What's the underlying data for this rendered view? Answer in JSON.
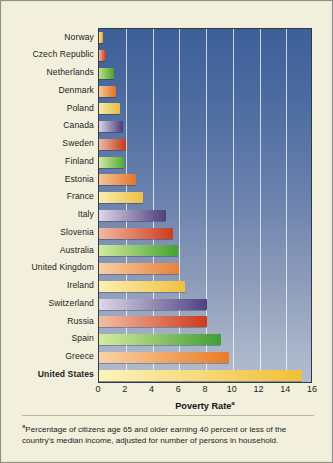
{
  "chart_data": {
    "type": "bar",
    "orientation": "horizontal",
    "title": "",
    "xlabel": "Poverty Rate",
    "xlabel_superscript": "a",
    "ylabel": "",
    "xlim": [
      0,
      16
    ],
    "xticks": [
      0,
      2,
      4,
      6,
      8,
      10,
      12,
      14,
      16
    ],
    "xtick_labels": [
      "0",
      "2",
      "4",
      "6",
      "8",
      "10",
      "12",
      "14",
      "16"
    ],
    "grid": "vertical-only",
    "legend": "none",
    "categories": [
      "Norway",
      "Czech Republic",
      "Netherlands",
      "Denmark",
      "Poland",
      "Canada",
      "Sweden",
      "Finland",
      "Estonia",
      "France",
      "Italy",
      "Slovenia",
      "Australia",
      "United Kingdom",
      "Ireland",
      "Switzerland",
      "Russia",
      "Spain",
      "Greece",
      "United States"
    ],
    "values": [
      0.3,
      0.5,
      1.1,
      1.3,
      1.6,
      1.8,
      2.0,
      1.9,
      2.8,
      3.3,
      5.0,
      5.5,
      5.9,
      6.0,
      6.4,
      8.1,
      8.1,
      9.1,
      9.7,
      15.2
    ],
    "bar_colors_start": [
      "#f6e39a",
      "#e8b5a0",
      "#bde08a",
      "#f2c79d",
      "#f7e8a8",
      "#d9d2e6",
      "#e9b9a6",
      "#cfe9a8",
      "#f3c49c",
      "#f9edb2",
      "#ded6e8",
      "#f0b9a4",
      "#d4ea9e",
      "#f6cfa6",
      "#fbf0b4",
      "#ded8ea",
      "#f3bda6",
      "#d7ec9e",
      "#f9d3a8",
      "#fdf3bb"
    ],
    "bar_colors_end": [
      "#eaa221",
      "#c0381d",
      "#4ba32e",
      "#e2701d",
      "#e8bc3c",
      "#4b3d77",
      "#c23a19",
      "#58a92f",
      "#e4762a",
      "#ecc044",
      "#4c3f7c",
      "#cf3a1d",
      "#45a232",
      "#e8813a",
      "#efc040",
      "#4e4180",
      "#cd3a1c",
      "#3f9e34",
      "#e87c28",
      "#f0bf37"
    ],
    "highlight_category": "United States",
    "footnote_marker": "a",
    "footnote": "Percentage of citizens age 65 and older earning 40 percent or less of the country's median income, adjusted for number of persons in household.",
    "plot_background_top": "#3f5f99",
    "plot_background_bottom": "#b2bccd",
    "page_background": "#f2f0dc",
    "gridline_color": "#ffffff"
  }
}
